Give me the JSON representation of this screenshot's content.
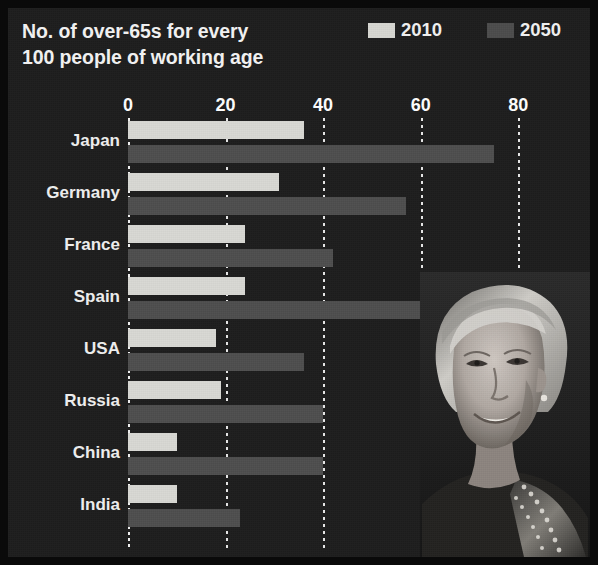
{
  "chart_data": {
    "type": "bar",
    "title_line1": "No. of over-65s for every",
    "title_line2": "100 people of working age",
    "orientation": "horizontal",
    "xlabel": "",
    "ylabel": "",
    "xlim": [
      0,
      82
    ],
    "xticks": [
      0,
      20,
      40,
      60,
      80
    ],
    "xtick_labels": [
      "0",
      "20",
      "40",
      "60",
      "80"
    ],
    "grid": "vertical dotted white gridlines at each x tick",
    "legend_position": "top-right",
    "categories": [
      "Japan",
      "Germany",
      "France",
      "Spain",
      "USA",
      "Russia",
      "China",
      "India"
    ],
    "series": [
      {
        "name": "2010",
        "color": "#d9d9d4",
        "values": [
          36,
          31,
          24,
          24,
          18,
          19,
          10,
          10
        ]
      },
      {
        "name": "2050",
        "color": "#4e4e4e",
        "values": [
          75,
          57,
          42,
          60,
          36,
          40,
          40,
          23
        ]
      }
    ]
  },
  "header": {
    "title_line1": "No. of over-65s for every",
    "title_line2": "100 people of working age",
    "legend": [
      {
        "label": "2010",
        "swatch": "light-gray-swatch",
        "color": "#d7d7d2"
      },
      {
        "label": "2050",
        "swatch": "dark-gray-swatch",
        "color": "#4c4c4c"
      }
    ]
  },
  "colors": {
    "background": "#1d1d1d",
    "page": "#0a0a0a",
    "text": "#f2f2f2",
    "series_2010": "#d9d9d4",
    "series_2050": "#4e4e4e",
    "gridline": "#e8e8e8"
  },
  "photo": {
    "caption": "",
    "alt_name": "elderly-woman-portrait"
  }
}
